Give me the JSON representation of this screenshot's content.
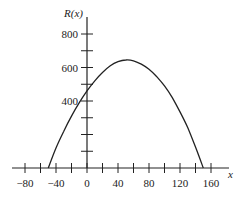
{
  "chart_data": {
    "type": "line",
    "title": "",
    "xlabel": "x",
    "ylabel": "R(x)",
    "xlim": [
      -95,
      180
    ],
    "ylim": [
      0,
      870
    ],
    "grid": false,
    "legend": null,
    "x_ticks": [
      -80,
      -60,
      -40,
      -20,
      0,
      20,
      40,
      60,
      80,
      100,
      120,
      140,
      160
    ],
    "x_tick_labels": [
      "−80",
      "−40",
      "0",
      "40",
      "80",
      "120",
      "160"
    ],
    "x_tick_label_values": [
      -80,
      -40,
      0,
      40,
      80,
      120,
      160
    ],
    "y_ticks": [
      100,
      200,
      300,
      400,
      500,
      600,
      700,
      800
    ],
    "y_tick_labels": [
      "400",
      "600",
      "800"
    ],
    "y_tick_label_values": [
      400,
      600,
      800
    ],
    "series": [
      {
        "name": "R(x)",
        "description": "Downward-opening parabola, roots near x = -50 and x = 150, vertex near (50, 650), R(0) = 500",
        "x": [
          -50,
          -40,
          -30,
          -20,
          -10,
          0,
          10,
          20,
          30,
          40,
          50,
          60,
          70,
          80,
          90,
          100,
          110,
          120,
          130,
          140,
          150
        ],
        "y": [
          0,
          120,
          220,
          310,
          390,
          460,
          520,
          570,
          610,
          635,
          645,
          640,
          620,
          590,
          545,
          490,
          420,
          335,
          240,
          125,
          0
        ]
      }
    ]
  }
}
